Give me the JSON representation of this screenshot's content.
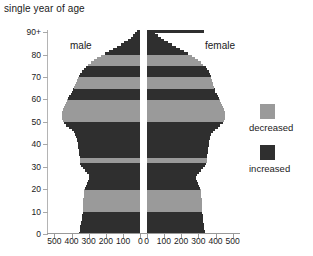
{
  "chart_data": {
    "type": "bar",
    "title": "single year of age",
    "xlabel": "",
    "ylabel": "",
    "orientation": "horizontal",
    "layout": "population-pyramid-back-to-back",
    "grid": false,
    "legend_position": "right",
    "axis": {
      "y_ticks": [
        "0",
        "10",
        "20",
        "30",
        "40",
        "50",
        "60",
        "70",
        "80",
        "90+"
      ],
      "y_tick_values": [
        0,
        10,
        20,
        30,
        40,
        50,
        60,
        70,
        80,
        90
      ],
      "ylim": [
        0,
        91
      ],
      "x_ticks_left": [
        "500",
        "400",
        "300",
        "200",
        "100",
        "0"
      ],
      "x_ticks_right": [
        "0",
        "100",
        "200",
        "300",
        "400",
        "500"
      ],
      "xlim_left": [
        0,
        500
      ],
      "xlim_right": [
        0,
        500
      ]
    },
    "side_labels": {
      "left": "male",
      "right": "female"
    },
    "legend": [
      {
        "label": "decreased",
        "color": "#9a9a9a"
      },
      {
        "label": "increased",
        "color": "#2f2f2f"
      }
    ],
    "colors": {
      "decreased": "#9a9a9a",
      "increased": "#2f2f2f"
    },
    "categories": [
      0,
      1,
      2,
      3,
      4,
      5,
      6,
      7,
      8,
      9,
      10,
      11,
      12,
      13,
      14,
      15,
      16,
      17,
      18,
      19,
      20,
      21,
      22,
      23,
      24,
      25,
      26,
      27,
      28,
      29,
      30,
      31,
      32,
      33,
      34,
      35,
      36,
      37,
      38,
      39,
      40,
      41,
      42,
      43,
      44,
      45,
      46,
      47,
      48,
      49,
      50,
      51,
      52,
      53,
      54,
      55,
      56,
      57,
      58,
      59,
      60,
      61,
      62,
      63,
      64,
      65,
      66,
      67,
      68,
      69,
      70,
      71,
      72,
      73,
      74,
      75,
      76,
      77,
      78,
      79,
      80,
      81,
      82,
      83,
      84,
      85,
      86,
      87,
      88,
      89,
      90
    ],
    "series": [
      {
        "name": "male",
        "side": "left",
        "values": [
          355,
          352,
          350,
          348,
          345,
          343,
          340,
          338,
          337,
          335,
          335,
          335,
          334,
          333,
          332,
          331,
          330,
          329,
          327,
          325,
          322,
          318,
          312,
          306,
          300,
          296,
          300,
          310,
          322,
          334,
          344,
          350,
          352,
          352,
          353,
          354,
          356,
          358,
          360,
          362,
          364,
          366,
          368,
          372,
          378,
          386,
          398,
          414,
          430,
          444,
          452,
          456,
          458,
          458,
          456,
          452,
          446,
          440,
          434,
          428,
          420,
          412,
          404,
          398,
          392,
          386,
          380,
          374,
          368,
          362,
          356,
          348,
          340,
          330,
          318,
          304,
          288,
          270,
          250,
          228,
          205,
          182,
          158,
          134,
          112,
          92,
          73,
          56,
          41,
          28,
          20
        ],
        "states": [
          "increased",
          "increased",
          "increased",
          "increased",
          "increased",
          "increased",
          "increased",
          "increased",
          "increased",
          "increased",
          "decreased",
          "decreased",
          "decreased",
          "decreased",
          "decreased",
          "decreased",
          "decreased",
          "decreased",
          "decreased",
          "decreased",
          "increased",
          "increased",
          "increased",
          "increased",
          "increased",
          "increased",
          "increased",
          "increased",
          "increased",
          "increased",
          "increased",
          "increased",
          "decreased",
          "decreased",
          "increased",
          "increased",
          "increased",
          "increased",
          "increased",
          "increased",
          "increased",
          "increased",
          "increased",
          "increased",
          "increased",
          "increased",
          "increased",
          "increased",
          "increased",
          "increased",
          "decreased",
          "decreased",
          "decreased",
          "decreased",
          "decreased",
          "decreased",
          "decreased",
          "decreased",
          "decreased",
          "decreased",
          "increased",
          "increased",
          "increased",
          "increased",
          "increased",
          "decreased",
          "decreased",
          "decreased",
          "decreased",
          "decreased",
          "increased",
          "increased",
          "increased",
          "increased",
          "increased",
          "decreased",
          "decreased",
          "decreased",
          "decreased",
          "decreased",
          "increased",
          "increased",
          "increased",
          "increased",
          "increased",
          "increased",
          "increased",
          "increased",
          "increased",
          "increased",
          "increased"
        ]
      },
      {
        "name": "female",
        "side": "right",
        "values": [
          340,
          338,
          336,
          334,
          332,
          330,
          328,
          326,
          325,
          323,
          322,
          322,
          321,
          320,
          320,
          319,
          318,
          317,
          316,
          314,
          310,
          306,
          300,
          294,
          288,
          286,
          292,
          304,
          318,
          330,
          340,
          346,
          350,
          350,
          351,
          352,
          354,
          356,
          358,
          360,
          362,
          364,
          366,
          370,
          376,
          384,
          396,
          412,
          428,
          442,
          450,
          454,
          456,
          456,
          454,
          450,
          444,
          438,
          432,
          426,
          418,
          412,
          406,
          400,
          396,
          392,
          388,
          384,
          380,
          376,
          372,
          366,
          360,
          352,
          342,
          330,
          316,
          300,
          282,
          262,
          240,
          218,
          194,
          170,
          146,
          124,
          102,
          82,
          64,
          48,
          335
        ],
        "states": [
          "increased",
          "increased",
          "increased",
          "increased",
          "increased",
          "increased",
          "increased",
          "increased",
          "increased",
          "increased",
          "decreased",
          "decreased",
          "decreased",
          "decreased",
          "decreased",
          "decreased",
          "decreased",
          "decreased",
          "decreased",
          "decreased",
          "increased",
          "increased",
          "increased",
          "increased",
          "increased",
          "increased",
          "increased",
          "increased",
          "increased",
          "increased",
          "increased",
          "increased",
          "decreased",
          "decreased",
          "increased",
          "increased",
          "increased",
          "increased",
          "increased",
          "increased",
          "increased",
          "increased",
          "increased",
          "increased",
          "increased",
          "increased",
          "increased",
          "increased",
          "increased",
          "increased",
          "decreased",
          "decreased",
          "decreased",
          "decreased",
          "decreased",
          "decreased",
          "decreased",
          "decreased",
          "decreased",
          "decreased",
          "increased",
          "increased",
          "increased",
          "increased",
          "increased",
          "decreased",
          "decreased",
          "decreased",
          "decreased",
          "decreased",
          "increased",
          "increased",
          "increased",
          "increased",
          "increased",
          "decreased",
          "decreased",
          "decreased",
          "decreased",
          "decreased",
          "increased",
          "increased",
          "increased",
          "increased",
          "increased",
          "increased",
          "increased",
          "increased",
          "increased",
          "increased",
          "increased"
        ]
      }
    ]
  }
}
